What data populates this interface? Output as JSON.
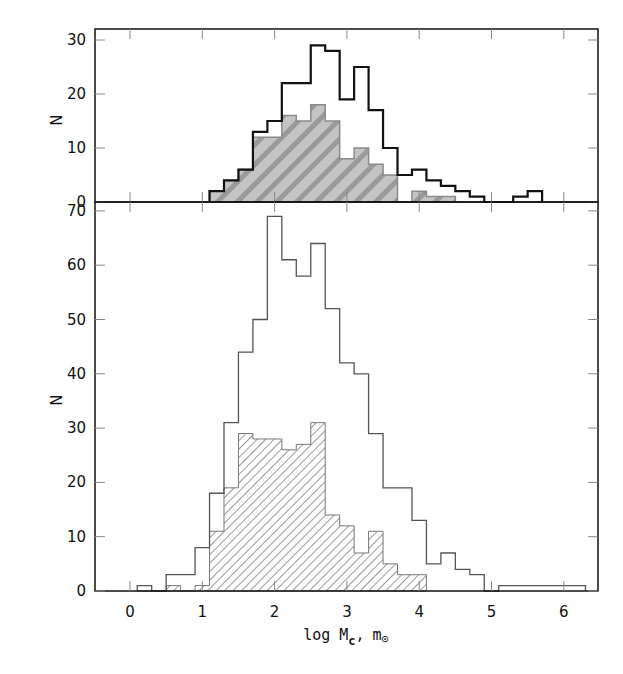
{
  "chart_data": [
    {
      "panel": "top",
      "type": "bar",
      "subtype": "step-histogram",
      "title": "",
      "xlabel": "",
      "ylabel": "N",
      "xlim": [
        -0.48,
        6.48
      ],
      "ylim": [
        0,
        32
      ],
      "yticks": [
        0,
        10,
        20,
        30
      ],
      "xticks": [
        0,
        1,
        2,
        3,
        4,
        5,
        6
      ],
      "grid": false,
      "bin_width": 0.2,
      "series": [
        {
          "name": "all",
          "style": "thick-outline",
          "color": "#111111",
          "bin_edges_start": 1.1,
          "values": [
            2,
            4,
            6,
            13,
            15,
            22,
            22,
            29,
            28,
            19,
            25,
            17,
            10,
            5,
            6,
            4,
            3,
            2,
            1,
            0,
            0,
            1,
            2
          ]
        },
        {
          "name": "subset",
          "style": "gray-hatched-fill",
          "color": "#b8b8b8",
          "bin_edges_start": 1.1,
          "values": [
            2,
            4,
            6,
            12,
            12,
            16,
            15,
            18,
            15,
            8,
            10,
            7,
            5,
            0,
            2,
            1,
            1
          ]
        }
      ]
    },
    {
      "panel": "bottom",
      "type": "bar",
      "subtype": "step-histogram",
      "title": "",
      "xlabel": "log M_c, m_sun",
      "ylabel": "N",
      "xlim": [
        -0.48,
        6.48
      ],
      "ylim": [
        0,
        71.5
      ],
      "yticks": [
        0,
        10,
        20,
        30,
        40,
        50,
        60,
        70
      ],
      "xticks": [
        0,
        1,
        2,
        3,
        4,
        5,
        6
      ],
      "grid": false,
      "bin_width": 0.2,
      "series": [
        {
          "name": "all",
          "style": "thin-outline",
          "color": "#555555",
          "bin_edges_start": 0.1,
          "values": [
            1,
            0,
            3,
            3,
            8,
            18,
            31,
            44,
            50,
            69,
            61,
            58,
            64,
            52,
            42,
            40,
            29,
            19,
            19,
            13,
            5,
            7,
            4,
            3,
            0,
            1,
            1,
            1,
            1,
            1,
            1
          ]
        },
        {
          "name": "subset",
          "style": "diagonal-hatch",
          "color": "#888888",
          "bin_edges_start": 0.1,
          "values": [
            0,
            0,
            1,
            0,
            1,
            11,
            19,
            29,
            28,
            28,
            26,
            27,
            31,
            14,
            12,
            7,
            11,
            5,
            3,
            3
          ]
        }
      ]
    }
  ],
  "labels": {
    "top_ylabel": "N",
    "bottom_ylabel": "N",
    "xlabel_main": "log M",
    "xlabel_sub": "c",
    "xlabel_sep": ",",
    "xlabel_unit": "m",
    "xlabel_unit_symbol": "⊙"
  }
}
